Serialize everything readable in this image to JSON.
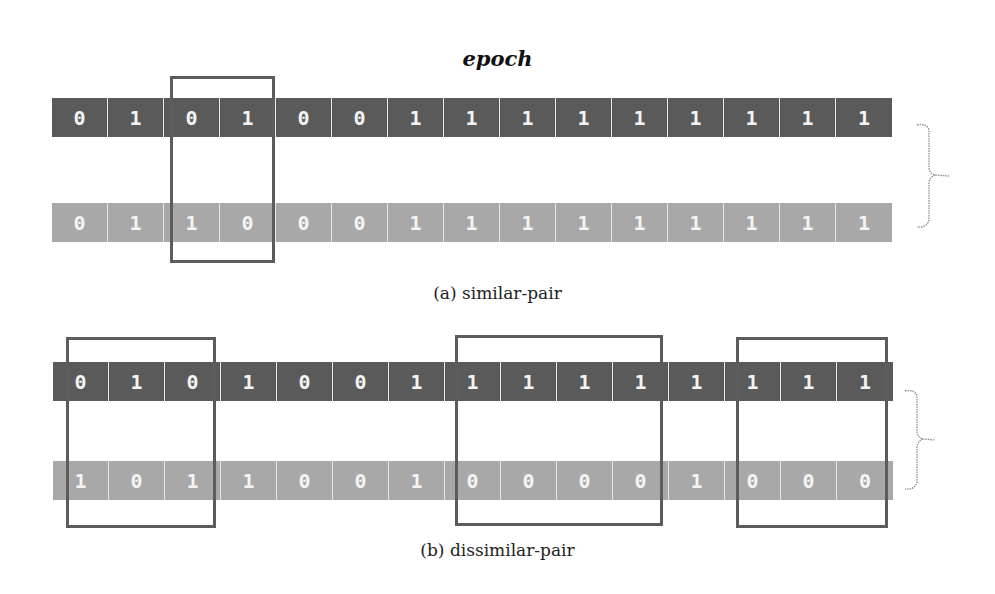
{
  "title": "epoch",
  "colors": {
    "dark_row": "#5a5a5a",
    "light_row": "#a8a8a8",
    "box_border": "#5c5c5c",
    "digit": "#f4f4f4"
  },
  "panel_a": {
    "caption": "(a) similar-pair",
    "top_row": [
      "0",
      "1",
      "0",
      "1",
      "0",
      "0",
      "1",
      "1",
      "1",
      "1",
      "1",
      "1",
      "1",
      "1",
      "1"
    ],
    "bottom_row": [
      "0",
      "1",
      "1",
      "0",
      "0",
      "0",
      "1",
      "1",
      "1",
      "1",
      "1",
      "1",
      "1",
      "1",
      "1"
    ],
    "highlight_boxes": [
      {
        "start_index": 2,
        "end_index": 3
      }
    ]
  },
  "panel_b": {
    "caption": "(b) dissimilar-pair",
    "top_row": [
      "0",
      "1",
      "0",
      "1",
      "0",
      "0",
      "1",
      "1",
      "1",
      "1",
      "1",
      "1",
      "1",
      "1",
      "1"
    ],
    "bottom_row": [
      "1",
      "0",
      "1",
      "1",
      "0",
      "0",
      "1",
      "0",
      "0",
      "0",
      "0",
      "1",
      "0",
      "0",
      "0"
    ],
    "highlight_boxes": [
      {
        "start_index": 0,
        "end_index": 2
      },
      {
        "start_index": 7,
        "end_index": 10
      },
      {
        "start_index": 12,
        "end_index": 14
      }
    ]
  }
}
